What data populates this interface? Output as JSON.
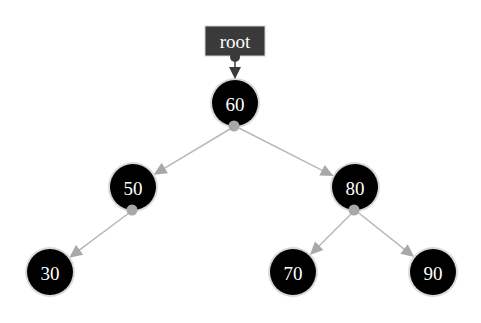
{
  "diagram": {
    "type": "binary-search-tree",
    "colors": {
      "node_fill": "#000000",
      "node_ring": "#d0d0d0",
      "node_text": "#ffffff",
      "edge": "#b8b8b8",
      "edge_dot": "#a8a8a8",
      "root_box": "#3a3a3a",
      "root_arrow": "#3a3a3a"
    },
    "root_pointer": {
      "label": "root",
      "x": 235,
      "y": 41,
      "w": 60,
      "h": 30
    },
    "nodes": [
      {
        "id": "n60",
        "label": "60",
        "x": 235,
        "y": 103
      },
      {
        "id": "n50",
        "label": "50",
        "x": 133,
        "y": 187
      },
      {
        "id": "n80",
        "label": "80",
        "x": 355,
        "y": 187
      },
      {
        "id": "n30",
        "label": "30",
        "x": 50,
        "y": 272
      },
      {
        "id": "n70",
        "label": "70",
        "x": 293,
        "y": 272
      },
      {
        "id": "n90",
        "label": "90",
        "x": 433,
        "y": 272
      }
    ],
    "edges": [
      {
        "from": "n60",
        "to": "n50"
      },
      {
        "from": "n60",
        "to": "n80"
      },
      {
        "from": "n50",
        "to": "n30"
      },
      {
        "from": "n80",
        "to": "n70"
      },
      {
        "from": "n80",
        "to": "n90"
      }
    ],
    "node_radius": 23
  }
}
